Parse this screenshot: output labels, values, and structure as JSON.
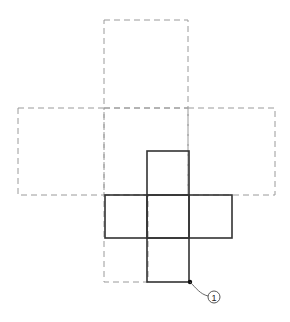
{
  "diagram": {
    "type": "cube-net-overlay",
    "colors": {
      "dashed": "#9a9a9a",
      "solid": "#333333",
      "background": "#ffffff"
    },
    "dashed_net": {
      "description": "Large cross-shaped net (dashed outline)",
      "squares": [
        {
          "name": "top",
          "x": 104,
          "y": 20,
          "w": 84,
          "h": 88
        },
        {
          "name": "left",
          "x": 18,
          "y": 108,
          "w": 86,
          "h": 87
        },
        {
          "name": "center",
          "x": 104,
          "y": 108,
          "w": 84,
          "h": 87
        },
        {
          "name": "right",
          "x": 188,
          "y": 108,
          "w": 87,
          "h": 87
        },
        {
          "name": "bottom-left",
          "x": 104,
          "y": 195,
          "w": 44,
          "h": 87
        }
      ]
    },
    "solid_net": {
      "description": "Small cross-shaped net (solid outline)",
      "squares": [
        {
          "name": "top",
          "x": 147,
          "y": 151,
          "w": 42,
          "h": 44
        },
        {
          "name": "left",
          "x": 105,
          "y": 195,
          "w": 42,
          "h": 43
        },
        {
          "name": "center",
          "x": 147,
          "y": 195,
          "w": 42,
          "h": 43
        },
        {
          "name": "right",
          "x": 189,
          "y": 195,
          "w": 43,
          "h": 43
        },
        {
          "name": "bottom",
          "x": 147,
          "y": 238,
          "w": 42,
          "h": 44
        }
      ]
    },
    "callout": {
      "label": "1",
      "point": {
        "x": 190,
        "y": 282
      },
      "circle": {
        "cx": 214,
        "cy": 297,
        "r": 6
      }
    }
  }
}
